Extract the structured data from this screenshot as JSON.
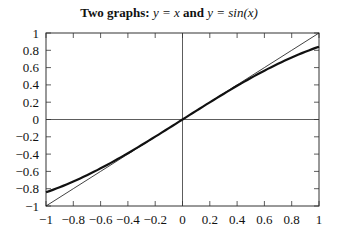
{
  "title": {
    "bold_prefix": "Two graphs:",
    "part1": "y = x",
    "conjunction": "and",
    "part2": "y = sin(x)"
  },
  "chart_data": {
    "type": "line",
    "title": "Two graphs: y = x and y = sin(x)",
    "xlabel": "",
    "ylabel": "",
    "xlim": [
      -1,
      1
    ],
    "ylim": [
      -1,
      1
    ],
    "grid": false,
    "zero_lines": true,
    "legend": null,
    "xticks": [
      -1,
      -0.8,
      -0.6,
      -0.4,
      -0.2,
      0,
      0.2,
      0.4,
      0.6,
      0.8,
      1
    ],
    "yticks": [
      -1,
      -0.8,
      -0.6,
      -0.4,
      -0.2,
      0,
      0.2,
      0.4,
      0.6,
      0.8,
      1
    ],
    "xtick_labels": [
      "−1",
      "−0.8",
      "−0.6",
      "−0.4",
      "−0.2",
      "0",
      "0.2",
      "0.4",
      "0.6",
      "0.8",
      "1"
    ],
    "ytick_labels": [
      "−1",
      "−0.8",
      "−0.6",
      "−0.4",
      "−0.2",
      "0",
      "0.2",
      "0.4",
      "0.6",
      "0.8",
      "1"
    ],
    "series": [
      {
        "name": "y = x",
        "style": "thin",
        "x": [
          -1,
          -0.8,
          -0.6,
          -0.4,
          -0.2,
          0,
          0.2,
          0.4,
          0.6,
          0.8,
          1
        ],
        "y": [
          -1,
          -0.8,
          -0.6,
          -0.4,
          -0.2,
          0,
          0.2,
          0.4,
          0.6,
          0.8,
          1
        ]
      },
      {
        "name": "y = sin(x)",
        "style": "thick",
        "x": [
          -1,
          -0.8,
          -0.6,
          -0.4,
          -0.2,
          0,
          0.2,
          0.4,
          0.6,
          0.8,
          1
        ],
        "y": [
          -0.841,
          -0.717,
          -0.565,
          -0.389,
          -0.199,
          0,
          0.199,
          0.389,
          0.565,
          0.717,
          0.841
        ]
      }
    ]
  },
  "colors": {
    "axis": "#333333",
    "line": "#111111",
    "background": "#ffffff"
  }
}
